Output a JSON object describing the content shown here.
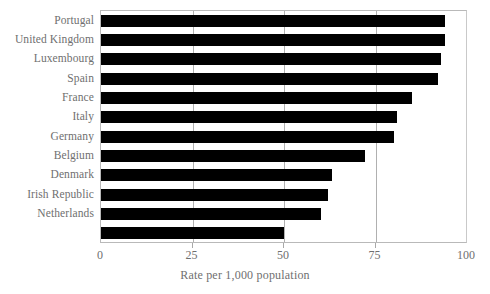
{
  "chart_data": {
    "type": "bar",
    "orientation": "horizontal",
    "title": "",
    "subtitle": "",
    "xlabel": "Rate per 1,000 population",
    "ylabel": "",
    "xlim": [
      0,
      100
    ],
    "xticks": [
      0,
      25,
      50,
      75,
      100
    ],
    "xtick_labels": [
      "0",
      "25",
      "50",
      "75",
      "100"
    ],
    "grid": "vertical-only",
    "legend": "none",
    "bar_color": "#000000",
    "categories": [
      "Portugal",
      "United Kingdom",
      "Luxembourg",
      "Spain",
      "France",
      "Italy",
      "Germany",
      "Belgium",
      "Denmark",
      "Irish Republic",
      "Netherlands",
      ""
    ],
    "values": [
      94,
      94,
      93,
      92,
      85,
      81,
      80,
      72,
      63,
      62,
      60,
      50
    ],
    "series": [
      {
        "name": "Rate per 1,000 population",
        "values": [
          94,
          94,
          93,
          92,
          85,
          81,
          80,
          72,
          63,
          62,
          60,
          50
        ]
      }
    ]
  },
  "axis": {
    "x_title": "Rate per 1,000 population",
    "tick_labels": [
      "0",
      "25",
      "50",
      "75",
      "100"
    ]
  },
  "colors": {
    "bar": "#000000",
    "frame": "#b9b9b9",
    "gridline": "#b0b0b0",
    "text": "#6f6f6f",
    "background": "#ffffff"
  }
}
